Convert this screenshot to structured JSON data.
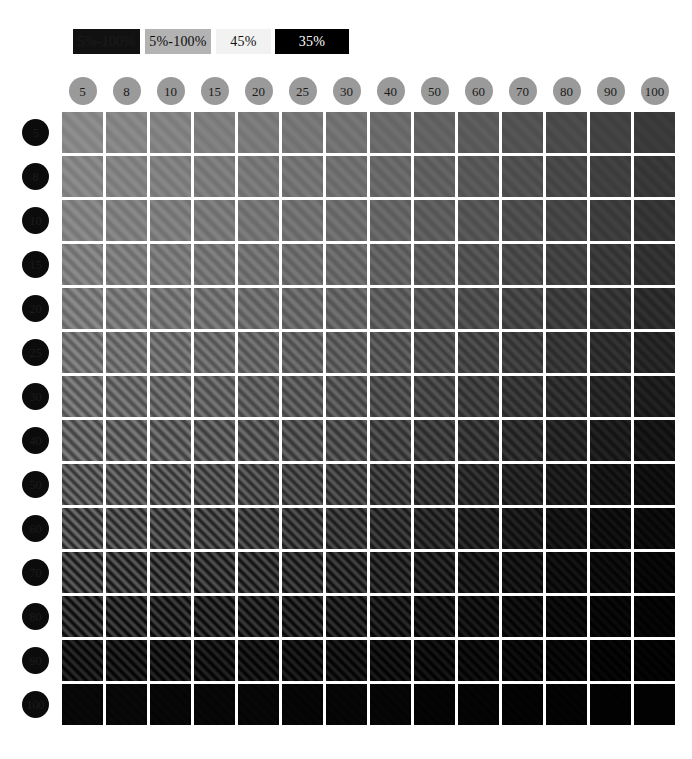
{
  "legend": {
    "items": [
      {
        "label": "5%-100%",
        "bg": "#111111",
        "fg": "#1b1b1b"
      },
      {
        "label": "5%-100%",
        "bg": "#b3b3b3",
        "fg": "#0d0d0d"
      },
      {
        "label": "45%",
        "bg": "#f2f2f2",
        "fg": "#111111"
      },
      {
        "label": "35%",
        "bg": "#000000",
        "fg": "#ffffff"
      }
    ]
  },
  "axes": {
    "columns": {
      "labels": [
        "5",
        "8",
        "10",
        "15",
        "20",
        "25",
        "30",
        "40",
        "50",
        "60",
        "70",
        "80",
        "90",
        "100"
      ],
      "marker_fill": "#9a9a9a",
      "marker_text": "#1a1a1a"
    },
    "rows": {
      "labels": [
        "5",
        "8",
        "10",
        "15",
        "20",
        "25",
        "30",
        "40",
        "50",
        "60",
        "70",
        "80",
        "90",
        "100"
      ],
      "marker_fill": "#0b0b0b",
      "marker_text": "#1c1c1c"
    }
  },
  "chart_data": {
    "type": "heatmap",
    "title": "",
    "xlabel": "",
    "ylabel": "",
    "categories_x": [
      "5",
      "8",
      "10",
      "15",
      "20",
      "25",
      "30",
      "40",
      "50",
      "60",
      "70",
      "80",
      "90",
      "100"
    ],
    "categories_y": [
      "5",
      "8",
      "10",
      "15",
      "20",
      "25",
      "30",
      "40",
      "50",
      "60",
      "70",
      "80",
      "90",
      "100"
    ],
    "cell_description": "diagonal sinusoidal grating patch; mean luminance decreases left-to-right and top-to-bottom, grating contrast increases toward lower-left",
    "mean_luminance": [
      [
        136,
        133,
        130,
        126,
        122,
        118,
        114,
        106,
        98,
        90,
        82,
        74,
        66,
        58
      ],
      [
        133,
        130,
        127,
        123,
        119,
        115,
        111,
        103,
        95,
        87,
        79,
        71,
        63,
        55
      ],
      [
        130,
        127,
        124,
        120,
        116,
        112,
        108,
        100,
        92,
        84,
        76,
        68,
        60,
        52
      ],
      [
        126,
        123,
        120,
        116,
        112,
        108,
        104,
        96,
        88,
        80,
        72,
        64,
        56,
        48
      ],
      [
        121,
        118,
        115,
        111,
        107,
        103,
        99,
        91,
        83,
        75,
        67,
        59,
        51,
        43
      ],
      [
        114,
        111,
        108,
        104,
        100,
        96,
        92,
        84,
        76,
        68,
        60,
        52,
        44,
        36
      ],
      [
        106,
        103,
        100,
        96,
        92,
        88,
        84,
        76,
        68,
        60,
        52,
        44,
        36,
        28
      ],
      [
        97,
        94,
        91,
        87,
        83,
        79,
        75,
        67,
        59,
        51,
        43,
        35,
        27,
        20
      ],
      [
        86,
        83,
        80,
        76,
        72,
        68,
        64,
        56,
        48,
        40,
        33,
        26,
        19,
        14
      ],
      [
        74,
        71,
        68,
        64,
        60,
        56,
        52,
        45,
        38,
        31,
        24,
        18,
        13,
        10
      ],
      [
        58,
        56,
        53,
        50,
        47,
        44,
        41,
        35,
        29,
        23,
        18,
        13,
        10,
        6
      ],
      [
        40,
        38,
        36,
        34,
        32,
        30,
        28,
        24,
        20,
        16,
        12,
        9,
        6,
        4
      ],
      [
        22,
        21,
        20,
        19,
        18,
        17,
        16,
        14,
        12,
        10,
        8,
        6,
        4,
        3
      ],
      [
        7,
        7,
        6,
        6,
        6,
        5,
        5,
        5,
        4,
        4,
        3,
        3,
        2,
        2
      ]
    ],
    "grating_contrast": [
      [
        0.05,
        0.05,
        0.05,
        0.05,
        0.05,
        0.05,
        0.05,
        0.05,
        0.05,
        0.05,
        0.05,
        0.05,
        0.05,
        0.05
      ],
      [
        0.07,
        0.07,
        0.07,
        0.07,
        0.07,
        0.07,
        0.07,
        0.07,
        0.07,
        0.07,
        0.07,
        0.07,
        0.07,
        0.07
      ],
      [
        0.09,
        0.09,
        0.09,
        0.09,
        0.09,
        0.09,
        0.09,
        0.09,
        0.09,
        0.09,
        0.09,
        0.09,
        0.09,
        0.09
      ],
      [
        0.12,
        0.12,
        0.12,
        0.12,
        0.12,
        0.12,
        0.12,
        0.12,
        0.12,
        0.12,
        0.12,
        0.12,
        0.12,
        0.12
      ],
      [
        0.16,
        0.16,
        0.16,
        0.16,
        0.16,
        0.16,
        0.16,
        0.16,
        0.16,
        0.16,
        0.16,
        0.16,
        0.16,
        0.16
      ],
      [
        0.2,
        0.2,
        0.2,
        0.2,
        0.2,
        0.2,
        0.2,
        0.2,
        0.2,
        0.2,
        0.2,
        0.2,
        0.2,
        0.2
      ],
      [
        0.25,
        0.25,
        0.25,
        0.25,
        0.25,
        0.25,
        0.25,
        0.25,
        0.25,
        0.25,
        0.25,
        0.25,
        0.25,
        0.25
      ],
      [
        0.32,
        0.32,
        0.32,
        0.32,
        0.32,
        0.32,
        0.32,
        0.32,
        0.32,
        0.32,
        0.32,
        0.32,
        0.32,
        0.32
      ],
      [
        0.4,
        0.4,
        0.4,
        0.4,
        0.4,
        0.4,
        0.4,
        0.4,
        0.4,
        0.4,
        0.4,
        0.4,
        0.4,
        0.4
      ],
      [
        0.5,
        0.5,
        0.5,
        0.5,
        0.5,
        0.5,
        0.5,
        0.5,
        0.5,
        0.5,
        0.5,
        0.5,
        0.5,
        0.5
      ],
      [
        0.64,
        0.64,
        0.64,
        0.64,
        0.64,
        0.64,
        0.64,
        0.64,
        0.64,
        0.64,
        0.64,
        0.64,
        0.64,
        0.64
      ],
      [
        0.78,
        0.78,
        0.78,
        0.78,
        0.78,
        0.78,
        0.78,
        0.78,
        0.78,
        0.78,
        0.78,
        0.78,
        0.78,
        0.78
      ],
      [
        0.9,
        0.9,
        0.9,
        0.9,
        0.9,
        0.9,
        0.9,
        0.9,
        0.9,
        0.9,
        0.9,
        0.9,
        0.9,
        0.9
      ],
      [
        0.3,
        0.3,
        0.3,
        0.3,
        0.3,
        0.3,
        0.3,
        0.3,
        0.3,
        0.3,
        0.3,
        0.3,
        0.3,
        0.3
      ]
    ],
    "grating_period_px": [
      [
        11,
        11,
        11,
        11,
        11,
        11,
        11,
        11,
        11,
        11,
        11,
        11,
        11,
        11
      ],
      [
        10,
        10,
        10,
        10,
        10,
        10,
        10,
        10,
        10,
        10,
        10,
        10,
        10,
        10
      ],
      [
        10,
        10,
        10,
        10,
        10,
        10,
        10,
        10,
        10,
        10,
        10,
        10,
        10,
        10
      ],
      [
        9,
        9,
        9,
        9,
        9,
        9,
        9,
        9,
        9,
        9,
        9,
        9,
        9,
        9
      ],
      [
        9,
        9,
        9,
        9,
        9,
        9,
        9,
        9,
        9,
        9,
        9,
        9,
        9,
        9
      ],
      [
        8,
        8,
        8,
        8,
        8,
        8,
        8,
        8,
        8,
        8,
        8,
        8,
        8,
        8
      ],
      [
        8,
        8,
        8,
        8,
        8,
        8,
        8,
        8,
        8,
        8,
        8,
        8,
        8,
        8
      ],
      [
        8,
        8,
        8,
        8,
        8,
        8,
        8,
        8,
        8,
        8,
        8,
        8,
        8,
        8
      ],
      [
        7,
        7,
        7,
        7,
        7,
        7,
        7,
        7,
        7,
        7,
        7,
        7,
        7,
        7
      ],
      [
        7,
        7,
        7,
        7,
        7,
        7,
        7,
        7,
        7,
        7,
        7,
        7,
        7,
        7
      ],
      [
        7,
        7,
        7,
        7,
        7,
        7,
        7,
        7,
        7,
        7,
        7,
        7,
        7,
        7
      ],
      [
        7,
        7,
        7,
        7,
        7,
        7,
        7,
        7,
        7,
        7,
        7,
        7,
        7,
        7
      ],
      [
        7,
        7,
        7,
        7,
        7,
        7,
        7,
        7,
        7,
        7,
        7,
        7,
        7,
        7
      ],
      [
        7,
        7,
        7,
        7,
        7,
        7,
        7,
        7,
        7,
        7,
        7,
        7,
        7,
        7
      ]
    ],
    "grating_angle_deg": 45,
    "grid": false,
    "legend_position": "top-left",
    "background": "#ffffff"
  },
  "layout": {
    "grid_origin_x": 62,
    "grid_origin_y": 112,
    "cell_size": 41,
    "cell_pitch": 44
  }
}
